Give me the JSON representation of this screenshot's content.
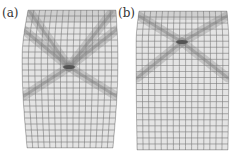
{
  "figure": {
    "panels": [
      {
        "id": "a",
        "label": "(a)",
        "label_pos": [
          2,
          7
        ],
        "outline": {
          "top_y": 10,
          "bottom_y": 148,
          "left_top_x": 28,
          "right_top_x": 116,
          "left_mid_x": 22,
          "right_mid_x": 118,
          "mid_y": 60,
          "left_bottom_x": 27,
          "right_bottom_x": 113
        },
        "grid": {
          "cols": 15,
          "rows": 23
        },
        "crossing": {
          "x": 69,
          "y": 67
        },
        "bands": [
          {
            "from": [
              24,
              30
            ],
            "to": [
              69,
              67
            ]
          },
          {
            "from": [
              116,
              30
            ],
            "to": [
              69,
              67
            ]
          },
          {
            "from": [
              69,
              67
            ],
            "to": [
              24,
              96
            ]
          },
          {
            "from": [
              69,
              67
            ],
            "to": [
              116,
              96
            ]
          },
          {
            "from": [
              30,
              12
            ],
            "to": [
              69,
              67
            ]
          },
          {
            "from": [
              112,
              12
            ],
            "to": [
              69,
              67
            ]
          }
        ],
        "top_shade": {
          "y0": 10,
          "y1": 22
        }
      },
      {
        "id": "b",
        "label": "(b)",
        "label_pos": [
          118,
          7
        ],
        "outline": {
          "top_y": 11,
          "bottom_y": 150,
          "left_top_x": 139,
          "right_top_x": 227,
          "left_mid_x": 136,
          "right_mid_x": 229,
          "mid_y": 45,
          "left_bottom_x": 137,
          "right_bottom_x": 228
        },
        "grid": {
          "cols": 15,
          "rows": 23
        },
        "crossing": {
          "x": 182,
          "y": 42
        },
        "bands": [
          {
            "from": [
              139,
              16
            ],
            "to": [
              182,
              42
            ]
          },
          {
            "from": [
              227,
              16
            ],
            "to": [
              182,
              42
            ]
          },
          {
            "from": [
              182,
              42
            ],
            "to": [
              137,
              78
            ]
          },
          {
            "from": [
              182,
              42
            ],
            "to": [
              228,
              78
            ]
          }
        ],
        "top_shade": {
          "y0": 11,
          "y1": 20
        }
      }
    ],
    "colors": {
      "background": "#ffffff",
      "mesh_fill": "#e4e4e4",
      "mesh_line": "#7a7a7a",
      "band": "#8c8c8c",
      "crossing": "#4a4a4a",
      "shade": "#c8c8c8",
      "label": "#333333"
    }
  }
}
